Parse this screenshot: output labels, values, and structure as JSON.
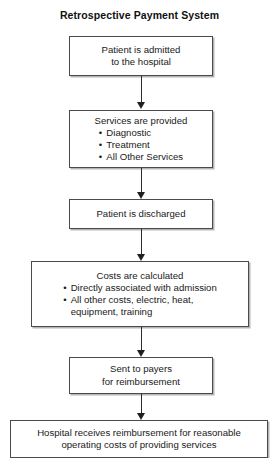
{
  "title": "Retrospective Payment System",
  "nodes": [
    {
      "id": "admitted",
      "heading": "Patient is admitted\nto the hospital",
      "bullets": []
    },
    {
      "id": "services",
      "heading": "Services are provided",
      "bullets": [
        "Diagnostic",
        "Treatment",
        "All Other Services"
      ]
    },
    {
      "id": "discharged",
      "heading": "Patient is discharged",
      "bullets": []
    },
    {
      "id": "costs",
      "heading": "Costs are calculated",
      "bullets": [
        "Directly associated with admission",
        "All other costs, electric, heat,\nequipment, training"
      ]
    },
    {
      "id": "payers",
      "heading": "Sent to payers\nfor reimbursement",
      "bullets": []
    },
    {
      "id": "reimbursement",
      "heading": "Hospital receives reimbursement for reasonable\noperating costs of providing services",
      "bullets": []
    }
  ],
  "connectors": [
    {
      "id": "admitted-to-services"
    },
    {
      "id": "services-to-discharged"
    },
    {
      "id": "discharged-to-costs"
    },
    {
      "id": "costs-to-payers"
    },
    {
      "id": "payers-to-reimbursement"
    }
  ]
}
